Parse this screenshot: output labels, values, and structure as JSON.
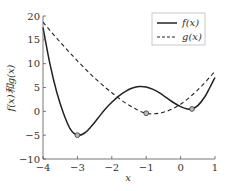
{
  "chart_data": {
    "type": "line",
    "title": "",
    "xlabel": "x",
    "ylabel": "f(x)和g(x)",
    "xlim": [
      -4,
      1
    ],
    "ylim": [
      -10,
      20
    ],
    "xticks": [
      -4,
      -3,
      -2,
      -1,
      0,
      1
    ],
    "yticks": [
      -10,
      -5,
      0,
      5,
      10,
      15,
      20
    ],
    "grid": false,
    "legend_position": "upper right",
    "series": [
      {
        "name": "f(x)",
        "style": "solid",
        "color": "#222222",
        "x": [
          -4,
          -3.8,
          -3.6,
          -3.4,
          -3.2,
          -3,
          -2.8,
          -2.6,
          -2.4,
          -2.2,
          -2,
          -1.8,
          -1.6,
          -1.4,
          -1.2,
          -1,
          -0.8,
          -0.6,
          -0.4,
          -0.2,
          0,
          0.2,
          0.33,
          0.5,
          0.7,
          0.85,
          1
        ],
        "y": [
          17.6,
          10,
          4,
          -0.5,
          -3.8,
          -5,
          -4.6,
          -3.2,
          -1.4,
          0.4,
          1.9,
          3.2,
          4.2,
          4.9,
          5.2,
          5.1,
          4.6,
          3.8,
          2.8,
          1.8,
          1.0,
          0.5,
          0.5,
          1.2,
          3.0,
          5.0,
          7.1
        ],
        "markers": [
          {
            "x": -3,
            "y": -5
          },
          {
            "x": 0.33,
            "y": 0.5
          }
        ]
      },
      {
        "name": "g(x)",
        "style": "dashed",
        "color": "#222222",
        "x": [
          -4,
          -3.5,
          -3,
          -2.5,
          -2,
          -1.5,
          -1,
          -0.5,
          0,
          0.5,
          1
        ],
        "y": [
          18.7,
          14.5,
          10.6,
          7,
          3.9,
          1.3,
          -0.4,
          -0.2,
          1.5,
          4.5,
          8.4
        ],
        "markers": [
          {
            "x": -1,
            "y": -0.4
          }
        ]
      }
    ]
  },
  "legend": {
    "items": [
      "f(x)",
      "g(x)"
    ]
  },
  "labels": {
    "x": "x",
    "y": "f(x)和g(x)"
  }
}
